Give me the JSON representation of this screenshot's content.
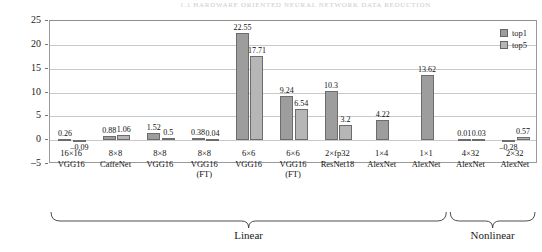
{
  "page_header": "1.1  Hardware  Oriented  Neural  Network  Data  Reduction",
  "chart_data": {
    "type": "bar",
    "title": "",
    "xlabel": "",
    "ylabel": "Accuracy loss (%)",
    "ylim": [
      -5,
      25
    ],
    "yticks": [
      -5,
      0,
      5,
      10,
      15,
      20,
      25
    ],
    "grid": true,
    "legend_position": "top-right",
    "legend": [
      "top1",
      "top5"
    ],
    "categories": [
      {
        "line1": "16×16",
        "line2": "VGG16",
        "line3": ""
      },
      {
        "line1": "8×8",
        "line2": "CaffeNet",
        "line3": ""
      },
      {
        "line1": "8×8",
        "line2": "VGG16",
        "line3": ""
      },
      {
        "line1": "8×8",
        "line2": "VGG16",
        "line3": "(FT)"
      },
      {
        "line1": "6×6",
        "line2": "VGG16",
        "line3": ""
      },
      {
        "line1": "6×6",
        "line2": "VGG16",
        "line3": "(FT)"
      },
      {
        "line1": "2×fp32",
        "line2": "ResNet18",
        "line3": ""
      },
      {
        "line1": "1×4",
        "line2": "AlexNet",
        "line3": ""
      },
      {
        "line1": "1×1",
        "line2": "AlexNet",
        "line3": ""
      },
      {
        "line1": "4×32",
        "line2": "AlexNet",
        "line3": ""
      },
      {
        "line1": "2×32",
        "line2": "AlexNet",
        "line3": ""
      }
    ],
    "series": [
      {
        "name": "top1",
        "values": [
          0.26,
          0.88,
          1.52,
          0.38,
          22.55,
          9.24,
          10.3,
          4.22,
          13.62,
          0.01,
          -0.28
        ],
        "labels": [
          "0.26",
          "0.88",
          "1.52",
          "0.38",
          "22.55",
          "9.24",
          "10.3",
          "4.22",
          "13.62",
          "0.01",
          "–0.28"
        ]
      },
      {
        "name": "top5",
        "values": [
          -0.09,
          1.06,
          0.5,
          0.04,
          17.71,
          6.54,
          3.2,
          null,
          null,
          0.03,
          0.57
        ],
        "labels": [
          "–0.09",
          "1.06",
          "0.5",
          "0.04",
          "17.71",
          "6.54",
          "3.2",
          "",
          "",
          "0.03",
          "0.57"
        ]
      }
    ],
    "groups": [
      {
        "label": "Linear",
        "from": 0,
        "to": 8
      },
      {
        "label": "Nonlinear",
        "from": 9,
        "to": 10
      }
    ]
  }
}
